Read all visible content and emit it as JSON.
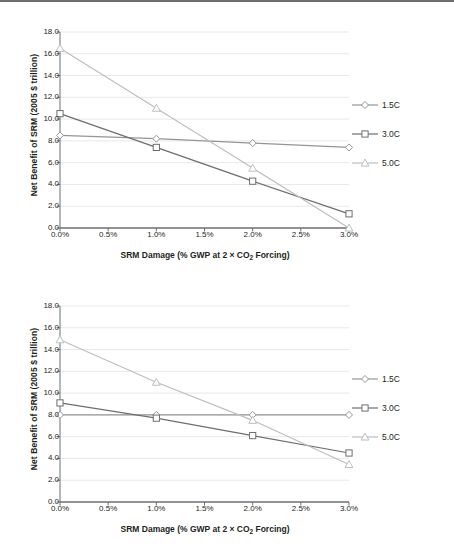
{
  "figure": {
    "axis_titles": {
      "y": "Net Benefit of SRM (2005 $ trillion)",
      "x_prefix": "SRM Damage (% GWP at 2 × CO",
      "x_sub": "2",
      "x_suffix": " Forcing)"
    },
    "legend": {
      "items": [
        {
          "label": "1.5C",
          "marker": "diamond",
          "color": "#939598"
        },
        {
          "label": "3.0C",
          "marker": "square",
          "color": "#6d6e71"
        },
        {
          "label": "5.0C",
          "marker": "triangle",
          "color": "#bcbec0"
        }
      ]
    },
    "ticks": {
      "y": [
        "18.0",
        "16.0",
        "14.0",
        "12.0",
        "10.0",
        "8.0",
        "6.0",
        "4.0",
        "2.0",
        "0.0"
      ],
      "x": [
        "0.0%",
        "0.5%",
        "1.0%",
        "1.5%",
        "2.0%",
        "2.5%",
        "3.0%"
      ]
    }
  },
  "chart_data": [
    {
      "type": "line",
      "panel": "top",
      "title": "",
      "xlabel": "SRM Damage (% GWP at 2 × CO2 Forcing)",
      "ylabel": "Net Benefit of SRM (2005 $ trillion)",
      "x": [
        0.0,
        1.0,
        2.0,
        3.0
      ],
      "x_tick_labels": [
        "0.0%",
        "0.5%",
        "1.0%",
        "1.5%",
        "2.0%",
        "2.5%",
        "3.0%"
      ],
      "xlim": [
        0.0,
        3.0
      ],
      "ylim": [
        0.0,
        18.0
      ],
      "ytick_step": 2.0,
      "grid": true,
      "legend_position": "right",
      "series": [
        {
          "name": "1.5C",
          "marker": "diamond",
          "color": "#939598",
          "values": [
            8.5,
            8.2,
            7.8,
            7.4
          ]
        },
        {
          "name": "3.0C",
          "marker": "square",
          "color": "#6d6e71",
          "values": [
            10.5,
            7.4,
            4.3,
            1.3
          ]
        },
        {
          "name": "5.0C",
          "marker": "triangle",
          "color": "#bcbec0",
          "values": [
            16.5,
            11.0,
            5.5,
            0.0
          ]
        }
      ]
    },
    {
      "type": "line",
      "panel": "bottom",
      "title": "",
      "xlabel": "SRM Damage (% GWP at 2 × CO2 Forcing)",
      "ylabel": "Net Benefit of SRM (2005 $ trillion)",
      "x": [
        0.0,
        1.0,
        2.0,
        3.0
      ],
      "x_tick_labels": [
        "0.0%",
        "0.5%",
        "1.0%",
        "1.5%",
        "2.0%",
        "2.5%",
        "3.0%"
      ],
      "xlim": [
        0.0,
        3.0
      ],
      "ylim": [
        0.0,
        18.0
      ],
      "ytick_step": 2.0,
      "grid": true,
      "legend_position": "right",
      "series": [
        {
          "name": "1.5C",
          "marker": "diamond",
          "color": "#939598",
          "values": [
            8.0,
            8.0,
            8.0,
            8.0
          ]
        },
        {
          "name": "3.0C",
          "marker": "square",
          "color": "#6d6e71",
          "values": [
            9.1,
            7.7,
            6.1,
            4.5
          ]
        },
        {
          "name": "5.0C",
          "marker": "triangle",
          "color": "#bcbec0",
          "values": [
            14.9,
            11.0,
            7.5,
            3.45
          ]
        }
      ]
    }
  ]
}
